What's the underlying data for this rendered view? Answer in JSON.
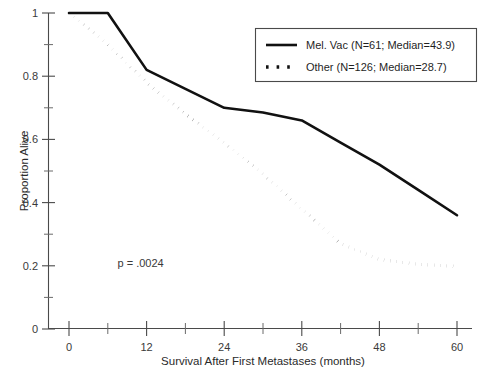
{
  "chart_data": {
    "type": "line",
    "title": "",
    "xlabel": "Survival After First Metastases (months)",
    "ylabel": "Proportion Alive",
    "xlim": [
      0,
      60
    ],
    "ylim": [
      0,
      1
    ],
    "grid": false,
    "legend_position": "top-right",
    "x_ticks": [
      0,
      12,
      24,
      36,
      48,
      60
    ],
    "x_tick_labels": [
      "0",
      "12",
      "24",
      "36",
      "48",
      "60"
    ],
    "x_minor_ticks": [
      6,
      18,
      30,
      42,
      54
    ],
    "y_ticks": [
      0,
      0.2,
      0.4,
      0.6,
      0.8,
      1
    ],
    "y_tick_labels": [
      "0",
      "0.2",
      "0.4",
      "0.6",
      "0.8",
      "1"
    ],
    "y_minor_ticks": [
      0.1,
      0.3,
      0.5,
      0.7,
      0.9
    ],
    "annotations": [
      {
        "text": "p = .0024",
        "x": 7.5,
        "y": 0.195
      }
    ],
    "series": [
      {
        "name": "Mel. Vac (N=61; Median=43.9)",
        "style": "solid",
        "n": 61,
        "median": 43.9,
        "x": [
          0,
          6,
          12,
          18,
          24,
          30,
          36,
          42,
          48,
          54,
          60
        ],
        "values": [
          1.0,
          1.0,
          0.82,
          0.76,
          0.7,
          0.685,
          0.66,
          0.59,
          0.52,
          0.44,
          0.36
        ]
      },
      {
        "name": "Other (N=126; Median=28.7)",
        "style": "dotted",
        "n": 126,
        "median": 28.7,
        "x": [
          0,
          6,
          12,
          18,
          24,
          30,
          36,
          42,
          48,
          54,
          60
        ],
        "values": [
          1.0,
          0.9,
          0.78,
          0.68,
          0.59,
          0.49,
          0.38,
          0.27,
          0.22,
          0.205,
          0.198
        ]
      }
    ]
  },
  "legend": {
    "entries": [
      {
        "label": "Mel. Vac (N=61; Median=43.9)",
        "style": "solid"
      },
      {
        "label": "Other (N=126; Median=28.7)",
        "style": "dotted"
      }
    ]
  },
  "axes": {
    "x_title": "Survival After First Metastases (months)",
    "y_title": "Proportion Alive"
  },
  "colors": {
    "curve": "#111111",
    "axis": "#4a4a4a",
    "text": "#1f1f1f",
    "background": "#ffffff"
  },
  "edge_artifact": {
    "text": ""
  }
}
